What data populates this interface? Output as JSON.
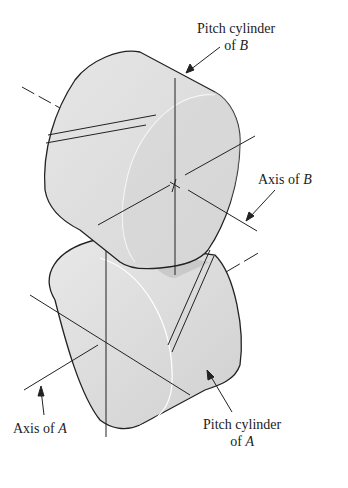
{
  "diagram": {
    "type": "crossed helical gears pitch cylinders",
    "labels": {
      "pitch_b_line1": "Pitch cylinder",
      "pitch_b_line2_prefix": "of ",
      "pitch_b_line2_var": "B",
      "axis_b_prefix": "Axis of ",
      "axis_b_var": "B",
      "axis_a_prefix": "Axis of ",
      "axis_a_var": "A",
      "pitch_a_line1": "Pitch cylinder",
      "pitch_a_line2_prefix": "of ",
      "pitch_a_line2_var": "A"
    },
    "colors": {
      "cylinder_fill": "#e4e4e4",
      "face_fill": "#dcdcdc",
      "shadow": "#c4c4c4",
      "line": "#222222"
    }
  }
}
